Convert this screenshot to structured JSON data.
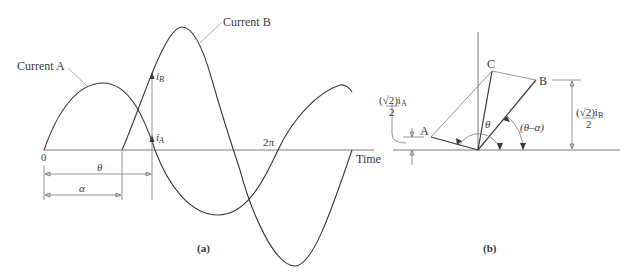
{
  "figure_a": {
    "caption": "(a)",
    "current_a_label": "Current A",
    "current_b_label": "Current B",
    "origin_label": "0",
    "two_pi_label": "2π",
    "time_label": "Time",
    "theta_label": "θ",
    "alpha_label": "α",
    "i_b_label": "i",
    "i_b_sub": "B",
    "i_a_label": "i",
    "i_a_sub": "A"
  },
  "figure_b": {
    "caption": "(b)",
    "point_a": "A",
    "point_b": "B",
    "point_c": "C",
    "theta_label": "θ",
    "theta_minus_alpha_label": "(θ–α)",
    "dim_a_numerator": "(√2)i",
    "dim_a_sub": "A",
    "dim_a_denominator": "2",
    "dim_b_numerator": "(√2)i",
    "dim_b_sub": "B",
    "dim_b_denominator": "2"
  },
  "colors": {
    "line": "#3a3a3a",
    "axis": "#6e6e6e",
    "background": "#ffffff"
  }
}
